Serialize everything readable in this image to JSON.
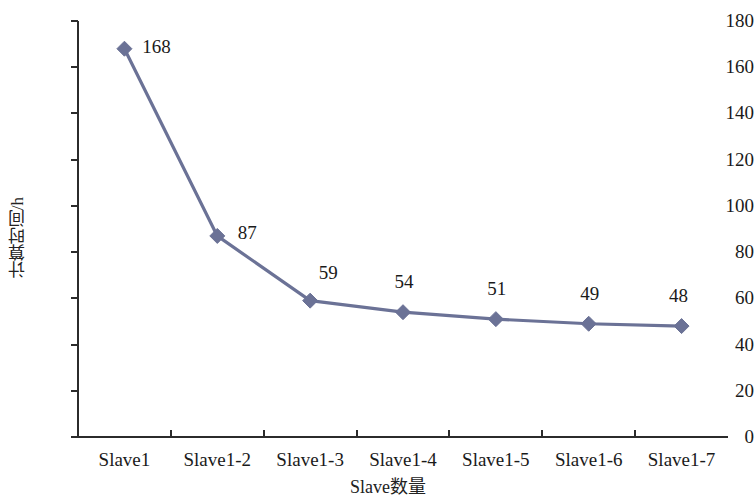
{
  "chart_data": {
    "type": "line",
    "title": "",
    "subtitle": "",
    "xlabel": "Slave数量",
    "ylabel": "计算时间/h",
    "categories": [
      "Slave1",
      "Slave1-2",
      "Slave1-3",
      "Slave1-4",
      "Slave1-5",
      "Slave1-6",
      "Slave1-7"
    ],
    "values": [
      168,
      87,
      59,
      54,
      51,
      49,
      48
    ],
    "point_labels": [
      "168",
      "87",
      "59",
      "54",
      "51",
      "49",
      "48"
    ],
    "series": [
      {
        "name": "计算时间/h",
        "values": [
          168,
          87,
          59,
          54,
          51,
          49,
          48
        ]
      }
    ],
    "ylim": [
      0,
      180
    ],
    "ytick_step": 20,
    "ytick_labels": [
      "180",
      "160",
      "140",
      "120",
      "100",
      "80",
      "60",
      "40",
      "20",
      "0"
    ],
    "ytick_values": [
      180,
      160,
      140,
      120,
      100,
      80,
      60,
      40,
      20,
      0
    ],
    "xlim_categories": 7,
    "grid": false,
    "legend": false,
    "legend_position": "none",
    "marker": "diamond",
    "series_color": "#6b7296",
    "axis_color": "#2b2b2b",
    "background_color": "#ffffff",
    "text_color": "#1a1a1a"
  }
}
